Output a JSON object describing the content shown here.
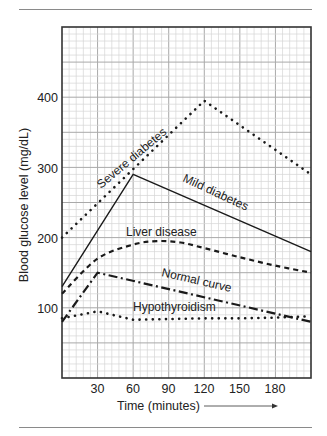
{
  "chart_data": {
    "type": "line",
    "title": "",
    "xlabel": "Time (minutes)",
    "ylabel": "Blood glucose level (mg/dL)",
    "xlim": [
      0,
      210
    ],
    "ylim": [
      0,
      500
    ],
    "x_ticks": [
      30,
      60,
      90,
      120,
      150,
      180
    ],
    "y_ticks": [
      100,
      200,
      300,
      400
    ],
    "grid": true,
    "legend": "inline labels on curves",
    "series": [
      {
        "name": "Severe diabetes",
        "style": "dotted",
        "points": [
          [
            0,
            200
          ],
          [
            120,
            395
          ],
          [
            210,
            290
          ]
        ]
      },
      {
        "name": "Mild diabetes",
        "style": "solid",
        "points": [
          [
            0,
            130
          ],
          [
            60,
            290
          ],
          [
            210,
            180
          ]
        ]
      },
      {
        "name": "Liver disease",
        "style": "dashed",
        "points": [
          [
            0,
            120
          ],
          [
            30,
            170
          ],
          [
            60,
            190
          ],
          [
            80,
            195
          ],
          [
            100,
            193
          ],
          [
            120,
            185
          ],
          [
            150,
            172
          ],
          [
            180,
            160
          ],
          [
            210,
            150
          ]
        ]
      },
      {
        "name": "Normal curve",
        "style": "dash-dot",
        "points": [
          [
            0,
            80
          ],
          [
            30,
            150
          ],
          [
            210,
            80
          ]
        ]
      },
      {
        "name": "Hypothyroidism",
        "style": "dotted",
        "points": [
          [
            0,
            85
          ],
          [
            30,
            95
          ],
          [
            60,
            83
          ],
          [
            90,
            84
          ],
          [
            120,
            85
          ],
          [
            150,
            85
          ],
          [
            180,
            86
          ],
          [
            210,
            88
          ]
        ]
      }
    ]
  },
  "labels": {
    "x_axis": "Time (minutes)",
    "y_axis": "Blood glucose level (mg/dL)",
    "x_ticks": [
      "30",
      "60",
      "90",
      "120",
      "150",
      "180"
    ],
    "y_ticks": [
      "100",
      "200",
      "300",
      "400"
    ],
    "curves": {
      "severe": "Severe diabetes",
      "mild": "Mild diabetes",
      "liver": "Liver disease",
      "normal": "Normal curve",
      "hypo": "Hypothyroidism"
    }
  },
  "icons": {
    "x_axis_arrow": "arrow-right-icon"
  }
}
